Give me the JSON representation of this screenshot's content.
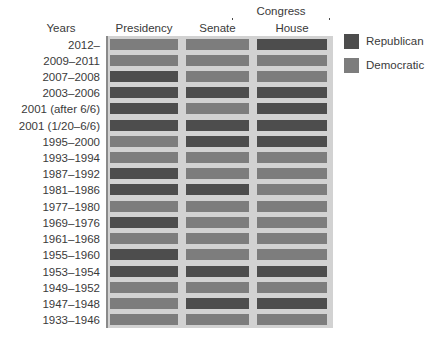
{
  "chart_data": {
    "type": "heatmap",
    "title": "",
    "xlabel": "",
    "ylabel": "Years",
    "grid": false,
    "legend_position": "right",
    "categories": [
      "Presidency",
      "Senate",
      "House"
    ],
    "group_header": "Congress",
    "group_columns": [
      "Senate",
      "House"
    ],
    "row_header": "Years",
    "value_labels": [
      "Republican",
      "Democratic"
    ],
    "colors": {
      "Republican": "#4d4d4d",
      "Democratic": "#7d7d7d",
      "panel_background": "#d2d2d2",
      "page_background": "#ffffff",
      "text": "#3a3a3a",
      "rule": "#8a8a8a"
    },
    "rows": [
      {
        "years": "2012–",
        "presidency": "Democratic",
        "senate": "Democratic",
        "house": "Republican"
      },
      {
        "years": "2009–2011",
        "presidency": "Democratic",
        "senate": "Democratic",
        "house": "Democratic"
      },
      {
        "years": "2007–2008",
        "presidency": "Republican",
        "senate": "Democratic",
        "house": "Democratic"
      },
      {
        "years": "2003–2006",
        "presidency": "Republican",
        "senate": "Republican",
        "house": "Republican"
      },
      {
        "years": "2001 (after 6/6)",
        "presidency": "Republican",
        "senate": "Democratic",
        "house": "Republican"
      },
      {
        "years": "2001 (1/20–6/6)",
        "presidency": "Republican",
        "senate": "Republican",
        "house": "Republican"
      },
      {
        "years": "1995–2000",
        "presidency": "Democratic",
        "senate": "Republican",
        "house": "Republican"
      },
      {
        "years": "1993–1994",
        "presidency": "Democratic",
        "senate": "Democratic",
        "house": "Democratic"
      },
      {
        "years": "1987–1992",
        "presidency": "Republican",
        "senate": "Democratic",
        "house": "Democratic"
      },
      {
        "years": "1981–1986",
        "presidency": "Republican",
        "senate": "Republican",
        "house": "Democratic"
      },
      {
        "years": "1977–1980",
        "presidency": "Democratic",
        "senate": "Democratic",
        "house": "Democratic"
      },
      {
        "years": "1969–1976",
        "presidency": "Republican",
        "senate": "Democratic",
        "house": "Democratic"
      },
      {
        "years": "1961–1968",
        "presidency": "Democratic",
        "senate": "Democratic",
        "house": "Democratic"
      },
      {
        "years": "1955–1960",
        "presidency": "Republican",
        "senate": "Democratic",
        "house": "Democratic"
      },
      {
        "years": "1953–1954",
        "presidency": "Republican",
        "senate": "Republican",
        "house": "Republican"
      },
      {
        "years": "1949–1952",
        "presidency": "Democratic",
        "senate": "Democratic",
        "house": "Democratic"
      },
      {
        "years": "1947–1948",
        "presidency": "Democratic",
        "senate": "Republican",
        "house": "Republican"
      },
      {
        "years": "1933–1946",
        "presidency": "Democratic",
        "senate": "Democratic",
        "house": "Democratic"
      }
    ]
  }
}
